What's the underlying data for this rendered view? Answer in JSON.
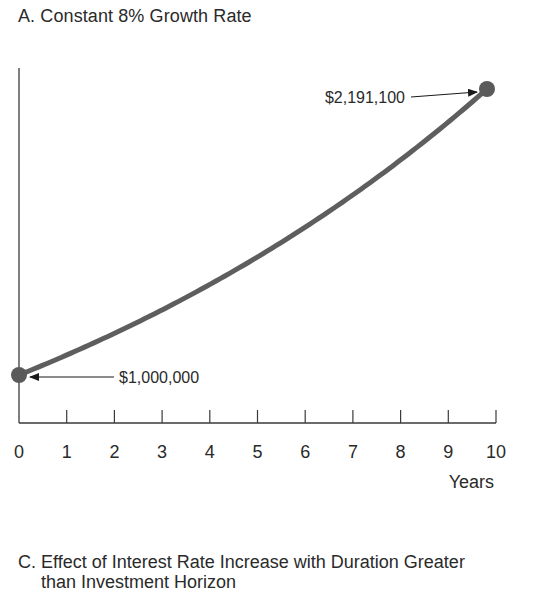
{
  "chart_data": {
    "type": "line",
    "title": "A.  Constant 8% Growth Rate",
    "xlabel": "Years",
    "ylabel": "",
    "x": [
      0,
      1,
      2,
      3,
      4,
      5,
      6,
      7,
      8,
      9,
      10
    ],
    "series": [
      {
        "name": "Portfolio value at 8% growth",
        "values": [
          1000000,
          1080000,
          1166400,
          1259712,
          1360489,
          1469328,
          1586874,
          1713824,
          1850930,
          1999005,
          2158925
        ]
      }
    ],
    "xticks": [
      "0",
      "1",
      "2",
      "3",
      "4",
      "5",
      "6",
      "7",
      "8",
      "9",
      "10"
    ],
    "xlim": [
      0,
      10
    ],
    "grid": false,
    "annotations": [
      {
        "x": 0,
        "value": 1000000,
        "label": "$1,000,000"
      },
      {
        "x": 10,
        "value": 2191100,
        "label": "$2,191,100"
      }
    ],
    "next_panel_title": "C.  Effect of Interest Rate Increase with Duration Greater than Investment Horizon"
  },
  "panel_a": {
    "title": "A.  Constant 8% Growth Rate",
    "xlabel": "Years",
    "start_label": "$1,000,000",
    "end_label": "$2,191,100"
  },
  "panel_c": {
    "title_line1": "C.  Effect of Interest Rate Increase with Duration Greater",
    "title_line2": "than Investment Horizon"
  },
  "colors": {
    "curve": "#5e5e5e",
    "axis": "#3a3a3a",
    "point": "#5a5a5a",
    "text": "#2a2a2a"
  }
}
